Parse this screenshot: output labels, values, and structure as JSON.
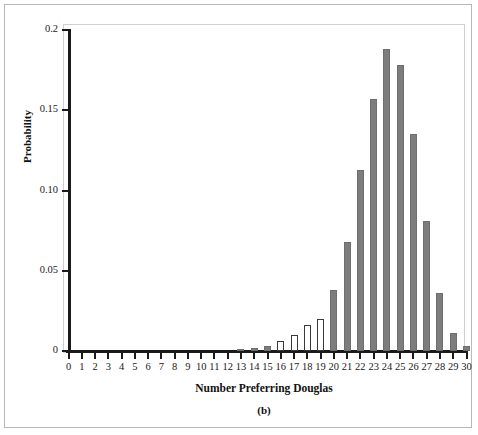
{
  "chart_data": {
    "type": "bar",
    "title": "",
    "panel_label": "(b)",
    "xlabel": "Number Preferring Douglas",
    "ylabel": "Probability",
    "xlim": [
      0,
      30
    ],
    "ylim": [
      0,
      0.2
    ],
    "grid": false,
    "legend": null,
    "ytick_labels": [
      "0",
      "0.05",
      "0.10",
      "0.15",
      "0.2"
    ],
    "ytick_values": [
      0,
      0.05,
      0.1,
      0.15,
      0.2
    ],
    "categories": [
      0,
      1,
      2,
      3,
      4,
      5,
      6,
      7,
      8,
      9,
      10,
      11,
      12,
      13,
      14,
      15,
      16,
      17,
      18,
      19,
      20,
      21,
      22,
      23,
      24,
      25,
      26,
      27,
      28,
      29,
      30
    ],
    "values": [
      0,
      0,
      0,
      0,
      0,
      0,
      0,
      0,
      0,
      0,
      0,
      0,
      0,
      0.001,
      0.002,
      0.003,
      0.006,
      0.01,
      0.016,
      0.02,
      0.038,
      0.068,
      0.113,
      0.157,
      0.188,
      0.178,
      0.135,
      0.081,
      0.036,
      0.011,
      0.003
    ],
    "bar_styles": [
      "filled",
      "filled",
      "filled",
      "filled",
      "filled",
      "filled",
      "filled",
      "filled",
      "filled",
      "filled",
      "filled",
      "filled",
      "filled",
      "filled",
      "filled",
      "filled",
      "hollow",
      "hollow",
      "hollow",
      "hollow",
      "filled",
      "filled",
      "filled",
      "filled",
      "filled",
      "filled",
      "filled",
      "filled",
      "filled",
      "filled",
      "filled"
    ],
    "colors": {
      "bar_fill": "#7d7d7d",
      "bar_outline": "#6e6e6e",
      "hollow_fill": "#ffffff",
      "hollow_outline": "#3a3a3a",
      "axis": "#1a1a1a"
    }
  }
}
